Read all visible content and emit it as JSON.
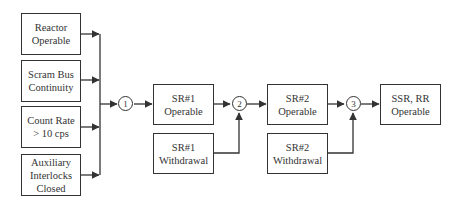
{
  "diagram": {
    "type": "logic-flow",
    "inputs": [
      {
        "id": "reactor",
        "label": "Reactor\nOperable"
      },
      {
        "id": "scram",
        "label": "Scram Bus\nContinuity"
      },
      {
        "id": "count",
        "label": "Count Rate\n> 10 cps"
      },
      {
        "id": "aux",
        "label": "Auxiliary\nInterlocks\nClosed"
      }
    ],
    "nodes": [
      {
        "id": "n1",
        "label": "1"
      },
      {
        "id": "n2",
        "label": "2"
      },
      {
        "id": "n3",
        "label": "3"
      }
    ],
    "boxes": {
      "sr1_operable": "SR#1\nOperable",
      "sr1_withdrawal": "SR#1\nWithdrawal",
      "sr2_operable": "SR#2\nOperable",
      "sr2_withdrawal": "SR#2\nWithdrawal",
      "final": "SSR, RR\nOperable"
    },
    "edges": [
      [
        "reactor",
        "n1"
      ],
      [
        "scram",
        "n1"
      ],
      [
        "count",
        "n1"
      ],
      [
        "aux",
        "n1"
      ],
      [
        "n1",
        "sr1_operable"
      ],
      [
        "sr1_operable",
        "n2"
      ],
      [
        "sr1_withdrawal",
        "n2"
      ],
      [
        "n2",
        "sr2_operable"
      ],
      [
        "sr2_operable",
        "n3"
      ],
      [
        "sr2_withdrawal",
        "n3"
      ],
      [
        "n3",
        "final"
      ]
    ],
    "colors": {
      "line": "#333333",
      "background": "#ffffff"
    }
  }
}
